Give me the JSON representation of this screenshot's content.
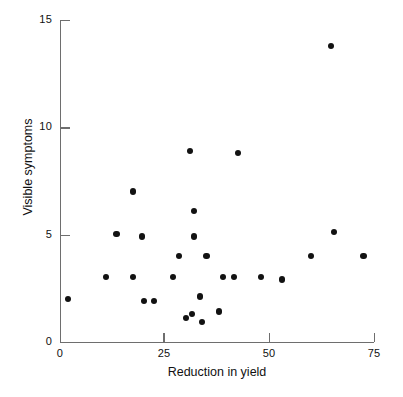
{
  "chart_data": {
    "type": "scatter",
    "title": "",
    "xlabel": "Reduction in yield",
    "ylabel": "Visible symptoms",
    "xlim": [
      0,
      75
    ],
    "ylim": [
      0,
      15
    ],
    "xticks": [
      0,
      25,
      50,
      75
    ],
    "yticks": [
      0,
      5,
      10,
      15
    ],
    "xtick_labels": [
      "0",
      "25",
      "50",
      "75"
    ],
    "ytick_labels": [
      "0",
      "5",
      "10",
      "15"
    ],
    "grid": false,
    "legend": null,
    "marker": {
      "shape": "circle",
      "color": "#121212",
      "size_px": 6.2
    },
    "axis_color": "#6e6e6e",
    "background": "#ffffff",
    "n_points": 31,
    "points": [
      {
        "x": 2.0,
        "y": 2.0
      },
      {
        "x": 11.0,
        "y": 3.0
      },
      {
        "x": 13.5,
        "y": 5.0
      },
      {
        "x": 17.5,
        "y": 7.0
      },
      {
        "x": 17.5,
        "y": 3.0
      },
      {
        "x": 19.5,
        "y": 4.9
      },
      {
        "x": 20.0,
        "y": 1.9
      },
      {
        "x": 22.5,
        "y": 1.9
      },
      {
        "x": 27.0,
        "y": 3.0
      },
      {
        "x": 28.5,
        "y": 4.0
      },
      {
        "x": 30.0,
        "y": 1.1
      },
      {
        "x": 31.0,
        "y": 8.9
      },
      {
        "x": 31.5,
        "y": 1.3
      },
      {
        "x": 32.0,
        "y": 6.1
      },
      {
        "x": 32.0,
        "y": 4.9
      },
      {
        "x": 33.5,
        "y": 2.1
      },
      {
        "x": 34.0,
        "y": 0.9
      },
      {
        "x": 35.0,
        "y": 4.0
      },
      {
        "x": 38.0,
        "y": 1.4
      },
      {
        "x": 39.0,
        "y": 3.0
      },
      {
        "x": 41.5,
        "y": 3.0
      },
      {
        "x": 42.5,
        "y": 8.8
      },
      {
        "x": 48.0,
        "y": 3.0
      },
      {
        "x": 53.0,
        "y": 2.9
      },
      {
        "x": 60.0,
        "y": 4.0
      },
      {
        "x": 64.8,
        "y": 13.8
      },
      {
        "x": 65.5,
        "y": 5.1
      },
      {
        "x": 72.5,
        "y": 4.0
      }
    ]
  },
  "axis": {
    "y_labels": [
      "15",
      "10",
      "5",
      "0"
    ],
    "x_labels": [
      "0",
      "25",
      "50",
      "75"
    ],
    "x_title": "Reduction in yield",
    "y_title": "Visible symptoms"
  }
}
